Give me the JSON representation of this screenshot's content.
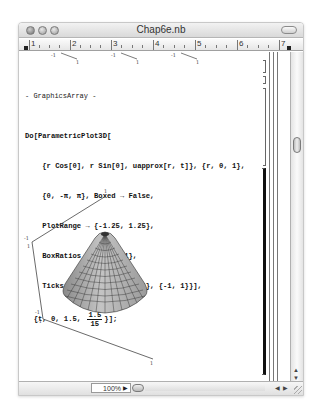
{
  "window": {
    "title": "Chap6e.nb",
    "controls": [
      "close",
      "minimize",
      "zoom"
    ]
  },
  "ruler": {
    "numbers": [
      "1",
      "2",
      "3",
      "4",
      "5",
      "6",
      "7"
    ]
  },
  "previous_output": {
    "tick_labels": [
      "-1",
      "1",
      "-1",
      "1",
      "-1",
      "1"
    ]
  },
  "notebook": {
    "output_label": "- GraphicsArray -",
    "input_lines": [
      "Do[ParametricPlot3D[",
      "    {r Cos[θ], r Sin[θ], uapprox[r, t]}, {r, 0, 1},",
      "    {θ, -π, π}, Boxed → False,",
      "    PlotRange → {-1.25, 1.25},",
      "    BoxRatios → {1, 1, 1},",
      "    Ticks → {{-1, 1}, {-1, 1}, {-1, 1}}],"
    ],
    "iterator_prefix": "  {t, 0, 1.5, ",
    "iterator_frac_num": "1.5",
    "iterator_frac_den": "15",
    "iterator_suffix": "}];",
    "plot": {
      "type": "3D parametric surface (cone-like)",
      "axis_tick_labels": {
        "top": "1",
        "upper_left_a": "-1",
        "upper_left_b": "1",
        "lower_left_a": "-1",
        "lower_left_b": "-1",
        "bottom_right": "1"
      },
      "surface_color": "#a9a9a9",
      "mesh_color": "#333333"
    },
    "section_title": "Example 3"
  },
  "statusbar": {
    "zoom_level": "100%",
    "zoom_arrow": "▶",
    "scroll_left": "◀",
    "scroll_right": "▶"
  },
  "scrollbar": {
    "up_arrow": "▲",
    "down_arrow": "▼"
  }
}
